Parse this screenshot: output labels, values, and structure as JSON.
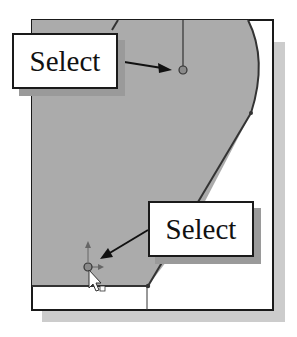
{
  "labels": {
    "top": "Select",
    "bottom": "Select"
  },
  "colors": {
    "region_fill": "#ababab",
    "frame_stroke": "#1a1a1a",
    "shadow": "#c8c8c8",
    "label_shadow": "#9a9a9a",
    "background": "#ffffff"
  },
  "icons": {
    "cursor": "arrow-pointer",
    "vertex_point": "circle-point",
    "origin_axes": "axis-arrows"
  }
}
